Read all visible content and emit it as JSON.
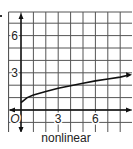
{
  "chart_data": {
    "type": "line",
    "title": "",
    "caption": "nonlinear",
    "xlabel": "",
    "ylabel": "",
    "origin_label": "O",
    "x_ticks": [
      {
        "value": 3,
        "label": "3"
      },
      {
        "value": 6,
        "label": "6"
      }
    ],
    "y_ticks": [
      {
        "value": 3,
        "label": "3"
      },
      {
        "value": 6,
        "label": "6"
      }
    ],
    "xlim": [
      -1,
      9
    ],
    "ylim": [
      -2,
      8
    ],
    "grid": true,
    "series": [
      {
        "name": "curve",
        "x": [
          0,
          0.5,
          1,
          2,
          3,
          4,
          5,
          6,
          7,
          8,
          9
        ],
        "y": [
          0.6,
          1.0,
          1.2,
          1.5,
          1.75,
          1.95,
          2.15,
          2.35,
          2.5,
          2.65,
          2.8
        ]
      }
    ]
  },
  "caption": "nonlinear",
  "colors": {
    "grid": "#555555",
    "axis": "#111111",
    "curve": "#111111"
  }
}
